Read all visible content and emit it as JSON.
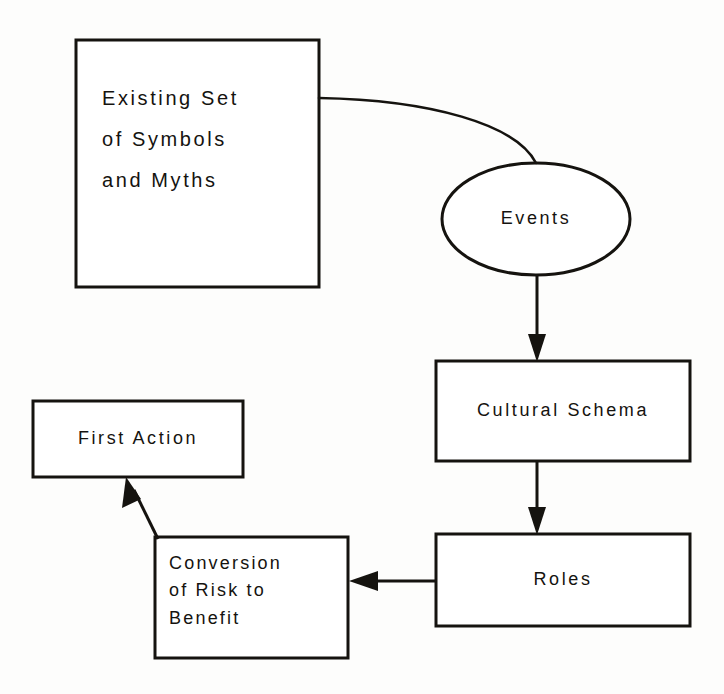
{
  "diagram": {
    "background_color": "#fdfdfc",
    "stroke_color": "#15130f",
    "text_color": "#15130f",
    "nodes": [
      {
        "id": "existing-set-of-symbols-and-myths",
        "shape": "rectangle",
        "lines": [
          "Existing Set",
          "of Symbols",
          "and Myths"
        ],
        "text": "Existing Set of Symbols and Myths",
        "x": 76,
        "y": 40,
        "width": 243,
        "height": 247
      },
      {
        "id": "events",
        "shape": "ellipse",
        "lines": [
          "Events"
        ],
        "text": "Events",
        "x": 442,
        "y": 163,
        "width": 188,
        "height": 112
      },
      {
        "id": "cultural-schema",
        "shape": "rectangle",
        "lines": [
          "Cultural Schema"
        ],
        "text": "Cultural Schema",
        "x": 436,
        "y": 361,
        "width": 254,
        "height": 100
      },
      {
        "id": "roles",
        "shape": "rectangle",
        "lines": [
          "Roles"
        ],
        "text": "Roles",
        "x": 436,
        "y": 534,
        "width": 254,
        "height": 92
      },
      {
        "id": "conversion-of-risk-to-benefit",
        "shape": "rectangle",
        "lines": [
          "Conversion",
          "of Risk to",
          "Benefit"
        ],
        "text": "Conversion of Risk to Benefit",
        "x": 155,
        "y": 537,
        "width": 193,
        "height": 121
      },
      {
        "id": "first-action",
        "shape": "rectangle",
        "lines": [
          "First Action"
        ],
        "text": "First Action",
        "x": 33,
        "y": 401,
        "width": 210,
        "height": 76
      }
    ],
    "connectors": [
      {
        "id": "existing-to-events",
        "from": "existing-set-of-symbols-and-myths",
        "to": "events",
        "style": "curve",
        "arrowhead": false
      },
      {
        "id": "events-to-cultural-schema",
        "from": "events",
        "to": "cultural-schema",
        "style": "straight-vertical",
        "arrowhead": true
      },
      {
        "id": "cultural-schema-to-roles",
        "from": "cultural-schema",
        "to": "roles",
        "style": "straight-vertical",
        "arrowhead": true
      },
      {
        "id": "roles-to-conversion",
        "from": "roles",
        "to": "conversion-of-risk-to-benefit",
        "style": "straight-horizontal",
        "arrowhead": true
      },
      {
        "id": "conversion-to-first-action",
        "from": "conversion-of-risk-to-benefit",
        "to": "first-action",
        "style": "diagonal",
        "arrowhead": true
      }
    ]
  }
}
